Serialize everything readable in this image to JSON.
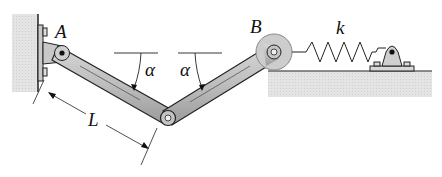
{
  "diagram": {
    "labels": {
      "pin_a": "A",
      "pin_b": "B",
      "spring_constant": "k",
      "angle_left": "α",
      "angle_right": "α",
      "length": "L"
    },
    "colors": {
      "bar_fill": "#b9b9b9",
      "bar_stroke": "#222222",
      "wall_fill": "#d4d4d4",
      "ground_fill": "#e2e2e2",
      "wheel_fill": "#c8c8c8",
      "line": "#222222"
    }
  }
}
